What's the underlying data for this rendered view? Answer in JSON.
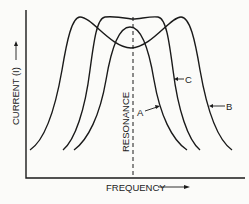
{
  "diagram": {
    "type": "resonance-curves",
    "axes": {
      "y_label": "CURRENT (I)",
      "x_label": "FREQUENCY",
      "y_arrow": "up",
      "x_arrow": "right"
    },
    "reference_line": {
      "label": "RESONANCE",
      "style": "dashed vertical"
    },
    "curves": [
      {
        "label": "A",
        "description": "narrow single peak centered at resonance"
      },
      {
        "label": "B",
        "description": "wide double-humped curve with dip at resonance"
      },
      {
        "label": "C",
        "description": "flat-topped curve centered at resonance"
      }
    ],
    "colors": {
      "background": "#fbfbf9",
      "ink": "#1a1a1a"
    }
  }
}
